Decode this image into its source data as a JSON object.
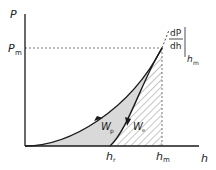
{
  "diagram": {
    "axes": {
      "y_label": "P",
      "x_label": "h"
    },
    "labels": {
      "P_max": {
        "main": "P",
        "sub": "m"
      },
      "h_r": {
        "main": "h",
        "sub": "r"
      },
      "h_m": {
        "main": "h",
        "sub": "m"
      },
      "W_p": {
        "main": "W",
        "sub": "p"
      },
      "W_e": {
        "main": "W",
        "sub": "e"
      },
      "slope_num": "dP",
      "slope_den": "dh",
      "slope_eval": {
        "main": "h",
        "sub": "m"
      }
    },
    "colors": {
      "curve": "#1a1a1a",
      "plastic_fill": "#d9d9d9",
      "hatch": "#8a8a8a",
      "dashed": "#555555"
    }
  }
}
